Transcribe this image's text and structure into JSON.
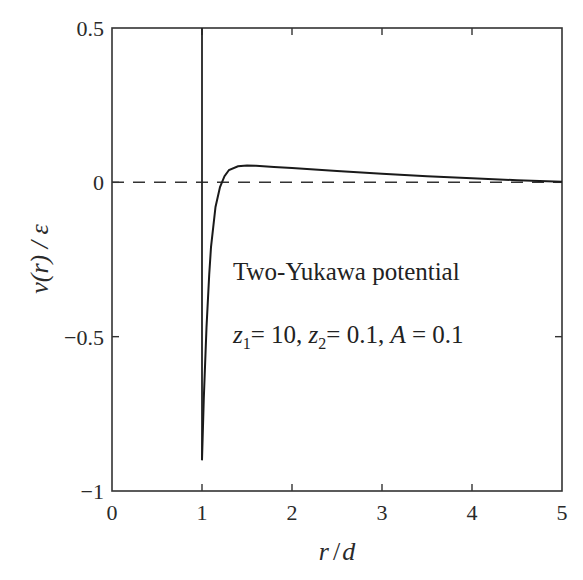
{
  "chart_data": {
    "type": "line",
    "title": "",
    "xlabel": "r / d",
    "ylabel": "v(r) / ε",
    "xlim": [
      0,
      5
    ],
    "ylim": [
      -1,
      0.5
    ],
    "xticks": [
      0,
      1,
      2,
      3,
      4,
      5
    ],
    "xtick_labels": [
      "0",
      "1",
      "2",
      "3",
      "4",
      "5"
    ],
    "yticks": [
      0.5,
      0,
      -0.5,
      -1
    ],
    "ytick_labels": [
      "0.5",
      "0",
      "−0.5",
      "−1"
    ],
    "grid": false,
    "legend": null,
    "annotations": [
      {
        "text": "Two-Yukawa potential",
        "x": 2.65,
        "y": -0.31
      },
      {
        "text": "z1 = 10, z2 = 0.1, A = 0.1",
        "x": 2.65,
        "y": -0.5
      }
    ],
    "reference_lines": [
      {
        "type": "horizontal",
        "y": 0,
        "style": "dashed"
      },
      {
        "type": "vertical",
        "x": 1,
        "style": "solid",
        "label": "hard core"
      }
    ],
    "series": [
      {
        "name": "Two-Yukawa potential",
        "style": "solid",
        "x": [
          1.0,
          1.02,
          1.05,
          1.08,
          1.1,
          1.15,
          1.2,
          1.25,
          1.3,
          1.4,
          1.5,
          1.6,
          1.8,
          2.0,
          2.5,
          3.0,
          3.5,
          4.0,
          4.5,
          5.0
        ],
        "y": [
          -0.9,
          -0.7,
          -0.47,
          -0.3,
          -0.21,
          -0.08,
          -0.015,
          0.02,
          0.04,
          0.052,
          0.055,
          0.054,
          0.05,
          0.046,
          0.037,
          0.028,
          0.02,
          0.013,
          0.007,
          0.002
        ]
      }
    ]
  },
  "labels": {
    "xlabel_r": "r",
    "xlabel_slash": "/",
    "xlabel_d": "d",
    "ylabel_text": "v(r) / ε",
    "annot_title": "Two-Yukawa potential",
    "annot_z1": "z",
    "annot_z1_sub": "1",
    "annot_z1_val": "= 10, ",
    "annot_z2": "z",
    "annot_z2_sub": "2",
    "annot_z2_val": "= 0.1, ",
    "annot_A": "A",
    "annot_A_val": " = 0.1"
  }
}
